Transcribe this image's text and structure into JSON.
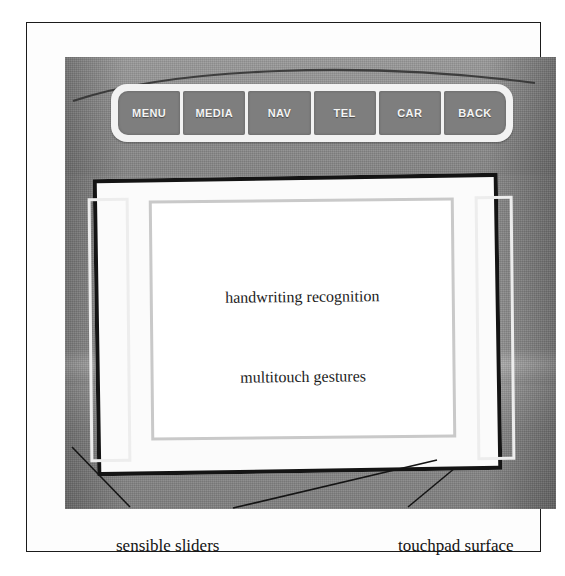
{
  "figure": {
    "colors": {
      "panel_grey": "#8d8d8d",
      "button_grey": "#7e7e7e",
      "bar_white": "#f2f2f2",
      "frame_black": "#141414",
      "slider_outline": "#ededed",
      "content_outline": "#c9c9c9",
      "text_black": "#141414"
    }
  },
  "button_bar": {
    "name": "hmi-hard-key-row",
    "buttons": [
      {
        "label": "MENU"
      },
      {
        "label": "MEDIA"
      },
      {
        "label": "NAV"
      },
      {
        "label": "TEL"
      },
      {
        "label": "CAR"
      },
      {
        "label": "BACK"
      }
    ]
  },
  "touchpad": {
    "name": "touchpad-surface",
    "content_labels": [
      "handwriting recognition",
      "multitouch gestures"
    ]
  },
  "sliders": {
    "left": {
      "name": "left-sensible-slider"
    },
    "right": {
      "name": "right-sensible-slider"
    }
  },
  "captions": [
    {
      "text": "sensible sliders"
    },
    {
      "text": "touchpad surface"
    }
  ]
}
